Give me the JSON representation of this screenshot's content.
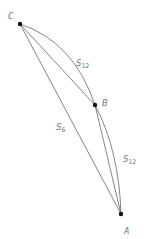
{
  "diagram": {
    "points": [
      {
        "id": "C",
        "label": "C",
        "x": 20,
        "y": 24
      },
      {
        "id": "B",
        "label": "B",
        "x": 95,
        "y": 105
      },
      {
        "id": "A",
        "label": "A",
        "x": 121,
        "y": 214
      }
    ],
    "segments": [
      {
        "from": "C",
        "to": "A",
        "type": "line",
        "label": "S",
        "subscript": "6"
      },
      {
        "from": "C",
        "to": "B",
        "type": "line"
      },
      {
        "from": "C",
        "to": "B",
        "type": "arc",
        "label": "S",
        "subscript": "12"
      },
      {
        "from": "B",
        "to": "A",
        "type": "line"
      },
      {
        "from": "B",
        "to": "A",
        "type": "arc",
        "label": "S",
        "subscript": "12"
      }
    ],
    "labels": {
      "C": "C",
      "B": "B",
      "A": "A",
      "s6_main": "S",
      "s6_sub": "6",
      "s12_top_main": "S",
      "s12_top_sub": "12",
      "s12_right_main": "S",
      "s12_right_sub": "12"
    },
    "colors": {
      "line": "#666666",
      "point": "#111111",
      "label": "#777777"
    }
  }
}
